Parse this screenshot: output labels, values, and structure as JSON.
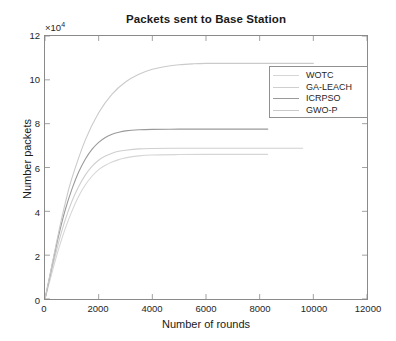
{
  "chart_data": {
    "type": "line",
    "title": "Packets sent to Base Station",
    "xlabel": "Number of rounds",
    "ylabel": "Number packets",
    "y_exponent_label": "×10",
    "y_exponent_power": "4",
    "xlim": [
      0,
      12000
    ],
    "ylim": [
      0,
      12
    ],
    "xticks": [
      0,
      2000,
      4000,
      6000,
      8000,
      10000,
      12000
    ],
    "xticklabels": [
      "0",
      "2000",
      "4000",
      "6000",
      "8000",
      "10000",
      "12000"
    ],
    "yticks": [
      0,
      2,
      4,
      6,
      8,
      10,
      12
    ],
    "yticklabels": [
      "0",
      "2",
      "4",
      "6",
      "8",
      "10",
      "12"
    ],
    "grid": false,
    "legend_position": "upper right",
    "y_units": "x 10^4 packets",
    "series": [
      {
        "name": "WOTC",
        "color": "#d6d6d6",
        "plateau": 6.6,
        "x_end": 8300,
        "x": [
          0,
          250,
          500,
          750,
          1000,
          1250,
          1500,
          1750,
          2000,
          2250,
          2500,
          2750,
          3000,
          3500,
          4000,
          5000,
          6000,
          7000,
          8300
        ],
        "y": [
          0,
          1.15,
          2.25,
          3.2,
          4.0,
          4.68,
          5.2,
          5.6,
          5.9,
          6.1,
          6.25,
          6.36,
          6.44,
          6.53,
          6.57,
          6.59,
          6.6,
          6.6,
          6.6
        ]
      },
      {
        "name": "GA-LEACH",
        "color": "#cfcfcf",
        "plateau": 6.88,
        "x_end": 9600,
        "x": [
          0,
          250,
          500,
          750,
          1000,
          1250,
          1500,
          1750,
          2000,
          2250,
          2500,
          2750,
          3000,
          3500,
          4000,
          5000,
          6000,
          7000,
          8000,
          9600
        ],
        "y": [
          0,
          1.3,
          2.55,
          3.6,
          4.45,
          5.12,
          5.65,
          6.05,
          6.33,
          6.52,
          6.65,
          6.74,
          6.79,
          6.85,
          6.87,
          6.88,
          6.88,
          6.88,
          6.88,
          6.88
        ]
      },
      {
        "name": "ICRPSO",
        "color": "#9a9a9a",
        "plateau": 7.75,
        "x_end": 8300,
        "x": [
          0,
          250,
          500,
          750,
          1000,
          1250,
          1500,
          1750,
          2000,
          2250,
          2500,
          2750,
          3000,
          3500,
          4000,
          5000,
          6000,
          7000,
          8300
        ],
        "y": [
          0,
          1.45,
          2.85,
          4.05,
          5.0,
          5.78,
          6.38,
          6.83,
          7.15,
          7.37,
          7.52,
          7.61,
          7.67,
          7.72,
          7.74,
          7.75,
          7.75,
          7.75,
          7.75
        ]
      },
      {
        "name": "GWO-P",
        "color": "#cacaca",
        "plateau": 10.75,
        "x_end": 10000,
        "x": [
          0,
          250,
          500,
          750,
          1000,
          1500,
          2000,
          2500,
          3000,
          3500,
          4000,
          4500,
          5000,
          5500,
          6000,
          7000,
          8000,
          9000,
          10000
        ],
        "y": [
          0,
          1.5,
          3.0,
          4.35,
          5.5,
          7.25,
          8.5,
          9.35,
          9.9,
          10.25,
          10.48,
          10.61,
          10.69,
          10.73,
          10.75,
          10.75,
          10.75,
          10.75,
          10.75
        ]
      }
    ]
  }
}
